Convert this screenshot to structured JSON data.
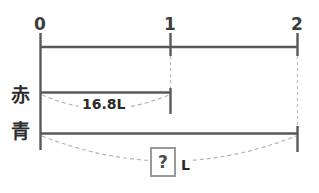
{
  "diagram": {
    "type": "double-number-line",
    "axis": {
      "ticks": [
        {
          "label": "0",
          "position": 0
        },
        {
          "label": "1",
          "position": 1
        },
        {
          "label": "2",
          "position": 2
        }
      ]
    },
    "rows": [
      {
        "label": "赤",
        "label_meaning": "red",
        "span_start": 0,
        "span_end": 1,
        "measure_label": "16.8L",
        "measure_value": 16.8,
        "measure_unit": "L",
        "unknown": false
      },
      {
        "label": "青",
        "label_meaning": "blue",
        "span_start": 0,
        "span_end": 2,
        "measure_label": "?",
        "measure_unit": "L",
        "unknown": true
      }
    ],
    "colors": {
      "stroke": "#595959",
      "dashed_stroke": "#b4b4b4",
      "box_border": "#9a9a9a",
      "text": "#2b2b2b",
      "background": "#ffffff"
    }
  }
}
